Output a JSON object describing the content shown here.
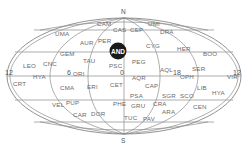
{
  "map": {
    "title": "All-sky constellation map",
    "poles": {
      "north": "N",
      "south": "S"
    },
    "hour_labels": {
      "left": "12",
      "center_left": "6",
      "center_right": "18",
      "right": "12",
      "center": "0"
    },
    "highlighted": {
      "label": "AND",
      "color": "#1a1a1a"
    },
    "constellations": [
      {
        "id": "cam",
        "label": "CAM",
        "x": 97,
        "y": 26
      },
      {
        "id": "cas",
        "label": "CAS",
        "x": 113,
        "y": 32
      },
      {
        "id": "cep",
        "label": "CEP",
        "x": 130,
        "y": 32
      },
      {
        "id": "umi",
        "label": "UMI",
        "x": 148,
        "y": 26
      },
      {
        "id": "dra",
        "label": "DRA",
        "x": 160,
        "y": 34
      },
      {
        "id": "uma",
        "label": "UMA",
        "x": 55,
        "y": 36
      },
      {
        "id": "aur",
        "label": "AUR",
        "x": 80,
        "y": 45
      },
      {
        "id": "per",
        "label": "PER",
        "x": 98,
        "y": 43
      },
      {
        "id": "cyg",
        "label": "CYG",
        "x": 146,
        "y": 48
      },
      {
        "id": "her",
        "label": "HER",
        "x": 177,
        "y": 51
      },
      {
        "id": "boo",
        "label": "BOO",
        "x": 203,
        "y": 56
      },
      {
        "id": "gem",
        "label": "GEM",
        "x": 60,
        "y": 56
      },
      {
        "id": "leo",
        "label": "LEO",
        "x": 23,
        "y": 68
      },
      {
        "id": "cnc",
        "label": "CNC",
        "x": 43,
        "y": 66
      },
      {
        "id": "tau",
        "label": "TAU",
        "x": 83,
        "y": 63
      },
      {
        "id": "psc",
        "label": "PSC",
        "x": 109,
        "y": 68
      },
      {
        "id": "peg",
        "label": "PEG",
        "x": 132,
        "y": 64
      },
      {
        "id": "aql",
        "label": "AQL",
        "x": 160,
        "y": 72
      },
      {
        "id": "ser",
        "label": "SER",
        "x": 192,
        "y": 71
      },
      {
        "id": "ori",
        "label": "ORI",
        "x": 73,
        "y": 76
      },
      {
        "id": "hya1",
        "label": "HYA",
        "x": 33,
        "y": 79
      },
      {
        "id": "aqr",
        "label": "AQR",
        "x": 132,
        "y": 80
      },
      {
        "id": "oph",
        "label": "OPH",
        "x": 180,
        "y": 79
      },
      {
        "id": "vir",
        "label": "VIR",
        "x": 227,
        "y": 79
      },
      {
        "id": "crt",
        "label": "CRT",
        "x": 13,
        "y": 86
      },
      {
        "id": "cma",
        "label": "CMA",
        "x": 60,
        "y": 90
      },
      {
        "id": "eri",
        "label": "ERI",
        "x": 87,
        "y": 89
      },
      {
        "id": "cet",
        "label": "CET",
        "x": 110,
        "y": 87
      },
      {
        "id": "cap",
        "label": "CAP",
        "x": 145,
        "y": 88
      },
      {
        "id": "lib",
        "label": "LIB",
        "x": 197,
        "y": 90
      },
      {
        "id": "hya2",
        "label": "HYA",
        "x": 212,
        "y": 95
      },
      {
        "id": "psa",
        "label": "PSA",
        "x": 130,
        "y": 98
      },
      {
        "id": "sgr",
        "label": "SGR",
        "x": 162,
        "y": 98
      },
      {
        "id": "sco",
        "label": "SCO",
        "x": 180,
        "y": 98
      },
      {
        "id": "vel",
        "label": "VEL",
        "x": 52,
        "y": 107
      },
      {
        "id": "pup",
        "label": "PUP",
        "x": 66,
        "y": 105
      },
      {
        "id": "phe",
        "label": "PHE",
        "x": 113,
        "y": 106
      },
      {
        "id": "gru",
        "label": "GRU",
        "x": 131,
        "y": 108
      },
      {
        "id": "cra",
        "label": "CRA",
        "x": 153,
        "y": 106
      },
      {
        "id": "cen",
        "label": "CEN",
        "x": 193,
        "y": 109
      },
      {
        "id": "car",
        "label": "CAR",
        "x": 73,
        "y": 117
      },
      {
        "id": "dor",
        "label": "DOR",
        "x": 91,
        "y": 116
      },
      {
        "id": "ara",
        "label": "ARA",
        "x": 162,
        "y": 114
      },
      {
        "id": "tuc",
        "label": "TUC",
        "x": 124,
        "y": 120
      },
      {
        "id": "pav",
        "label": "PAV",
        "x": 143,
        "y": 121
      }
    ]
  }
}
